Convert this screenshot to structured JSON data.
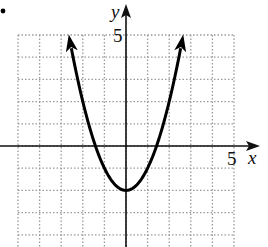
{
  "bullet": "•",
  "chart_data": {
    "type": "line",
    "title": "",
    "function": "y = x^2 - 2",
    "xlabel": "x",
    "ylabel": "y",
    "x_tick_label": {
      "value": 5,
      "text": "5"
    },
    "y_tick_label": {
      "value": 5,
      "text": "5"
    },
    "xlim": [
      -5,
      5
    ],
    "ylim": [
      -4.6,
      5
    ],
    "grid": true,
    "grid_style": "dotted",
    "grid_step": 1,
    "legend": null,
    "vertex": [
      0,
      -2
    ],
    "x_intercepts": [
      -1.41,
      1.41
    ],
    "arrows_on_ends": true,
    "series": [
      {
        "name": "parabola",
        "x": [
          -2.65,
          -2.5,
          -2,
          -1.5,
          -1,
          -0.5,
          0,
          0.5,
          1,
          1.5,
          2,
          2.5,
          2.65
        ],
        "y": [
          5.02,
          4.25,
          2,
          0.25,
          -1,
          -1.75,
          -2,
          -1.75,
          -1,
          0.25,
          2,
          4.25,
          5.02
        ]
      }
    ],
    "colors": {
      "curve": "#000000",
      "axes": "#111111",
      "grid": "#9a9a9a"
    }
  }
}
